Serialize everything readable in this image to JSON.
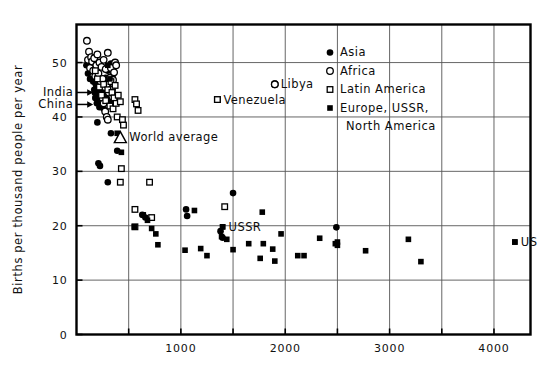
{
  "chart_data": {
    "type": "scatter",
    "title": "",
    "subtitle": "",
    "xlabel": "",
    "ylabel": "Births per thousand people per year",
    "xlim": [
      0,
      4350
    ],
    "ylim": [
      0,
      57
    ],
    "grid": true,
    "x_ticks_major": [
      1000,
      2000,
      3000,
      4000
    ],
    "x_ticks_minor": [
      500,
      1500,
      2500,
      3500
    ],
    "x_tick_labels": [
      "1000",
      "2000",
      "3000",
      "4000"
    ],
    "y_ticks": [
      0,
      10,
      20,
      30,
      40,
      50
    ],
    "y_tick_labels": [
      "0",
      "10",
      "20",
      "30",
      "40",
      "50"
    ],
    "legend_position": "top-right",
    "legend": [
      {
        "name": "Asia",
        "marker": "filled-circle"
      },
      {
        "name": "Africa",
        "marker": "open-circle"
      },
      {
        "name": "Latin America",
        "marker": "open-square"
      },
      {
        "name": "Europe, USSR,",
        "marker": "filled-square"
      },
      {
        "name": "North America",
        "marker": "none"
      }
    ],
    "legend_entries_flat": [
      "Asia",
      "Africa",
      "Latin America",
      "Europe, USSR, North America"
    ],
    "annotations": [
      {
        "text": "India",
        "marker": "filled-circle",
        "x": 160,
        "y": 44.5,
        "style": "arrow-left"
      },
      {
        "text": "China",
        "marker": "filled-circle",
        "x": 160,
        "y": 42.3,
        "style": "arrow-left"
      },
      {
        "text": "World average",
        "marker": "open-triangle",
        "x": 420,
        "y": 36.3,
        "style": "marker-left"
      },
      {
        "text": "Venezuela",
        "marker": "open-square",
        "x": 1350,
        "y": 43.2,
        "style": "marker-left"
      },
      {
        "text": "Libya",
        "marker": "open-circle",
        "x": 1900,
        "y": 46.0,
        "style": "marker-left"
      },
      {
        "text": "USSR",
        "marker": "filled-square",
        "x": 1400,
        "y": 19.8,
        "style": "marker-left"
      },
      {
        "text": "US",
        "marker": "filled-square",
        "x": 4200,
        "y": 17.0,
        "style": "marker-left"
      }
    ],
    "series": [
      {
        "name": "Asia",
        "marker": "filled-circle",
        "points": [
          [
            95,
            49.5
          ],
          [
            110,
            48.0
          ],
          [
            130,
            47.0
          ],
          [
            150,
            50.0
          ],
          [
            160,
            46.5
          ],
          [
            170,
            45.0
          ],
          [
            175,
            44.5
          ],
          [
            180,
            43.5
          ],
          [
            185,
            46.0
          ],
          [
            190,
            45.5
          ],
          [
            195,
            42.5
          ],
          [
            200,
            44.0
          ],
          [
            205,
            47.5
          ],
          [
            210,
            43.0
          ],
          [
            215,
            45.8
          ],
          [
            220,
            41.8
          ],
          [
            225,
            44.8
          ],
          [
            230,
            46.8
          ],
          [
            235,
            43.8
          ],
          [
            240,
            42.0
          ],
          [
            250,
            45.2
          ],
          [
            260,
            41.5
          ],
          [
            270,
            44.2
          ],
          [
            280,
            47.2
          ],
          [
            290,
            43.4
          ],
          [
            300,
            48.5
          ],
          [
            310,
            46.2
          ],
          [
            320,
            42.8
          ],
          [
            330,
            49.8
          ],
          [
            340,
            44.6
          ],
          [
            350,
            47.8
          ],
          [
            200,
            39.0
          ],
          [
            210,
            31.5
          ],
          [
            225,
            31.0
          ],
          [
            300,
            28.0
          ],
          [
            330,
            37.0
          ],
          [
            390,
            33.8
          ],
          [
            630,
            22.0
          ],
          [
            660,
            21.5
          ],
          [
            1050,
            23.0
          ],
          [
            1060,
            21.8
          ],
          [
            1380,
            19.0
          ],
          [
            1400,
            17.8
          ],
          [
            1500,
            26.0
          ],
          [
            2490,
            19.7
          ]
        ]
      },
      {
        "name": "Africa",
        "marker": "open-circle",
        "points": [
          [
            100,
            54.0
          ],
          [
            110,
            50.5
          ],
          [
            120,
            52.0
          ],
          [
            130,
            49.0
          ],
          [
            140,
            51.0
          ],
          [
            150,
            50.2
          ],
          [
            160,
            48.5
          ],
          [
            170,
            50.8
          ],
          [
            180,
            47.5
          ],
          [
            190,
            49.5
          ],
          [
            200,
            51.5
          ],
          [
            210,
            48.0
          ],
          [
            220,
            50.0
          ],
          [
            230,
            46.5
          ],
          [
            240,
            49.2
          ],
          [
            250,
            47.0
          ],
          [
            260,
            50.5
          ],
          [
            270,
            45.5
          ],
          [
            280,
            48.8
          ],
          [
            290,
            46.0
          ],
          [
            300,
            51.8
          ],
          [
            310,
            44.5
          ],
          [
            320,
            47.2
          ],
          [
            330,
            49.0
          ],
          [
            340,
            45.0
          ],
          [
            350,
            46.8
          ],
          [
            360,
            48.2
          ],
          [
            370,
            50.0
          ],
          [
            380,
            49.5
          ],
          [
            250,
            43.5
          ],
          [
            260,
            42.5
          ],
          [
            275,
            41.0
          ],
          [
            290,
            40.0
          ],
          [
            300,
            39.5
          ],
          [
            1900,
            46.0
          ]
        ]
      },
      {
        "name": "Latin America",
        "marker": "open-square",
        "points": [
          [
            180,
            48.5
          ],
          [
            200,
            47.0
          ],
          [
            220,
            45.5
          ],
          [
            240,
            44.0
          ],
          [
            260,
            46.0
          ],
          [
            280,
            43.0
          ],
          [
            300,
            45.0
          ],
          [
            320,
            42.0
          ],
          [
            330,
            46.5
          ],
          [
            340,
            44.5
          ],
          [
            350,
            41.5
          ],
          [
            360,
            43.5
          ],
          [
            370,
            45.8
          ],
          [
            380,
            42.5
          ],
          [
            390,
            40.0
          ],
          [
            400,
            44.0
          ],
          [
            420,
            42.8
          ],
          [
            440,
            39.5
          ],
          [
            560,
            43.2
          ],
          [
            575,
            42.4
          ],
          [
            590,
            41.2
          ],
          [
            450,
            38.5
          ],
          [
            430,
            30.5
          ],
          [
            420,
            28.0
          ],
          [
            560,
            23.0
          ],
          [
            700,
            28.0
          ],
          [
            720,
            21.5
          ],
          [
            1350,
            43.2
          ],
          [
            1420,
            23.5
          ],
          [
            560,
            19.8
          ]
        ]
      },
      {
        "name": "Europe, USSR, North America",
        "marker": "filled-square",
        "points": [
          [
            300,
            49.5
          ],
          [
            320,
            47.0
          ],
          [
            390,
            37.0
          ],
          [
            430,
            33.5
          ],
          [
            555,
            19.8
          ],
          [
            640,
            22.0
          ],
          [
            680,
            21.0
          ],
          [
            720,
            19.5
          ],
          [
            760,
            18.5
          ],
          [
            780,
            16.5
          ],
          [
            1040,
            15.5
          ],
          [
            1130,
            22.8
          ],
          [
            1190,
            15.8
          ],
          [
            1250,
            14.5
          ],
          [
            1390,
            18.0
          ],
          [
            1400,
            19.8
          ],
          [
            1440,
            17.5
          ],
          [
            1500,
            15.6
          ],
          [
            1650,
            16.7
          ],
          [
            1780,
            22.5
          ],
          [
            1760,
            14.0
          ],
          [
            1790,
            16.7
          ],
          [
            1880,
            15.7
          ],
          [
            1900,
            13.5
          ],
          [
            1960,
            18.5
          ],
          [
            2120,
            14.5
          ],
          [
            2180,
            14.5
          ],
          [
            2330,
            17.7
          ],
          [
            2480,
            16.7
          ],
          [
            2500,
            17.0
          ],
          [
            2500,
            16.4
          ],
          [
            2770,
            15.4
          ],
          [
            3180,
            17.5
          ],
          [
            3300,
            13.4
          ],
          [
            4200,
            17.0
          ]
        ]
      }
    ]
  }
}
